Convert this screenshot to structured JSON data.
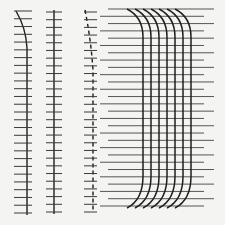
{
  "figure": {
    "background": "#f4f4f2",
    "stroke_color": "#1e1e1e",
    "ticks_color": "#3a3a3a",
    "horizontal_line_color": "#555555"
  },
  "panels": [
    {
      "id": "a",
      "type": "curved-axis-with-ticks",
      "x": 14,
      "top": 8,
      "bottom": 210,
      "tick_count": 27,
      "tick_half_width": 7,
      "curve": "top-bends-left"
    },
    {
      "id": "b",
      "type": "straight-axis-with-ticks",
      "x": 54,
      "top": 10,
      "bottom": 210,
      "tick_count": 27,
      "tick_half_width": 8
    },
    {
      "id": "c",
      "type": "dashed-curved-axis-with-ticks",
      "x": 93,
      "top": 10,
      "bottom": 210,
      "tick_count": 27,
      "tick_half_width": 8
    },
    {
      "id": "d",
      "type": "curved-bundle",
      "strands": 7,
      "x_start": 143,
      "x_step": 8,
      "top": 9,
      "bottom": 212,
      "horizontal_lines": 28
    }
  ]
}
